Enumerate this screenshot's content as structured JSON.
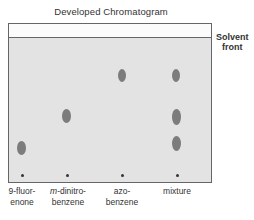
{
  "title": "Developed Chromatogram",
  "solvent_front_label_line1": "Solvent",
  "solvent_front_label_line2": "front",
  "lanes": [
    {
      "label_line1": "9-fluor-",
      "label_line2": "enone",
      "x": 22,
      "spots_y": [
        148
      ]
    },
    {
      "label_line1_italic": "m",
      "label_line1": "-dinitro-",
      "label_line2": "benzene",
      "x": 67,
      "spots_y": [
        116
      ]
    },
    {
      "label_line1": "azo-",
      "label_line2": "benzene",
      "x": 122,
      "spots_y": [
        76
      ]
    },
    {
      "label_line1": "mixture",
      "label_line2": "",
      "x": 177,
      "spots_y": [
        76,
        118,
        144
      ]
    }
  ],
  "colors": {
    "plate": "#e3e3e3",
    "spot": "#7c7c7c",
    "border": "#666666"
  }
}
